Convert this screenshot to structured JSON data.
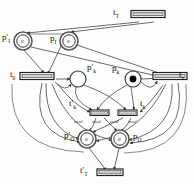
{
  "figure": {
    "type": "petri-net",
    "background": "#fefefe",
    "stroke": "#333333",
    "token_fill": "#000000"
  },
  "transitions": [
    {
      "id": "t_T",
      "label": "t",
      "sub": "T",
      "prime": false,
      "x": 148,
      "y": 14,
      "w": 34,
      "h": 7,
      "label_x": 113,
      "label_y": 9,
      "orientation": "horizontal"
    },
    {
      "id": "t_0",
      "label": "t",
      "sub": "0",
      "prime": false,
      "x": 37,
      "y": 76,
      "w": 34,
      "h": 7,
      "label_x": 18,
      "label_y": 72,
      "orientation": "horizontal"
    },
    {
      "id": "t_n",
      "label": "t",
      "sub": "n",
      "prime": false,
      "x": 170,
      "y": 76,
      "w": 34,
      "h": 7,
      "label_x": 178,
      "label_y": 72,
      "orientation": "horizontal"
    },
    {
      "id": "t_k_prime",
      "label": "t",
      "sub": "k",
      "prime": true,
      "x": 90,
      "y": 111,
      "w": 20,
      "h": 6,
      "label_x": 69,
      "label_y": 101,
      "orientation": "horizontal"
    },
    {
      "id": "t_k",
      "label": "t",
      "sub": "k",
      "prime": false,
      "x": 125,
      "y": 111,
      "w": 20,
      "h": 6,
      "label_x": 131,
      "label_y": 101,
      "orientation": "horizontal"
    },
    {
      "id": "t_T_prime",
      "label": "t",
      "sub": "T",
      "prime": true,
      "x": 105,
      "y": 172,
      "w": 26,
      "h": 7,
      "label_x": 84,
      "label_y": 168,
      "orientation": "horizontal"
    }
  ],
  "places": [
    {
      "id": "p_I_prime",
      "label": "p",
      "sub": "I",
      "prime": true,
      "cx": 23,
      "cy": 41,
      "r": 9,
      "double": true,
      "token": "0",
      "token_style": "numeric",
      "label_x": 3,
      "label_y": 36
    },
    {
      "id": "p_I",
      "label": "p",
      "sub": "I",
      "prime": false,
      "cx": 69,
      "cy": 41,
      "r": 9,
      "double": true,
      "token": "0",
      "token_style": "numeric",
      "label_x": 49,
      "label_y": 38
    },
    {
      "id": "p_k_prime",
      "label": "p",
      "sub": "k",
      "prime": true,
      "cx": 78,
      "cy": 79,
      "r": 8,
      "double": false,
      "token": "",
      "token_style": "empty",
      "label_x": 89,
      "label_y": 68
    },
    {
      "id": "p_k",
      "label": "p",
      "sub": "k",
      "prime": false,
      "cx": 133,
      "cy": 79,
      "r": 8,
      "double": false,
      "token": "",
      "token_style": "dot",
      "label_x": 111,
      "label_y": 68
    },
    {
      "id": "p_O_prime",
      "label": "p",
      "sub": "O",
      "prime": true,
      "cx": 87,
      "cy": 139,
      "r": 9,
      "double": true,
      "token": "0",
      "token_style": "numeric",
      "label_x": 66,
      "label_y": 134
    },
    {
      "id": "p_O",
      "label": "p",
      "sub": "O",
      "prime": false,
      "cx": 120,
      "cy": 139,
      "r": 9,
      "double": true,
      "token": "0",
      "token_style": "numeric",
      "label_x": 134,
      "label_y": 134
    }
  ],
  "annotations": [
    {
      "id": "ann-1",
      "text": "mod",
      "x": 78,
      "y": 121
    },
    {
      "id": "ann-2",
      "text": "mod",
      "x": 96,
      "y": 121
    },
    {
      "id": "ann-3",
      "text": "mod",
      "x": 113,
      "y": 121
    },
    {
      "id": "ann-4",
      "text": "mod",
      "x": 131,
      "y": 121
    }
  ],
  "arcs": {
    "count": 34,
    "description": "directed arcs connecting places and transitions"
  }
}
